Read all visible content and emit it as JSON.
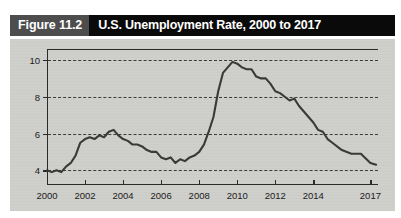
{
  "figure": {
    "number_label": "Figure 11.2",
    "title": "U.S. Unemployment Rate, 2000 to 2017",
    "number_bg_color": "#4d4d4d",
    "title_bg_color": "#0a0a0a",
    "title_text_color": "#ffffff",
    "panel_bg_color": "#cfcfcb",
    "line_color": "#3a3a3a",
    "grid_color": "#3c3c3c",
    "axis_color": "#2a2a2a"
  },
  "chart_data": {
    "type": "line",
    "title": "U.S. Unemployment Rate, 2000 to 2017",
    "xlabel": "",
    "ylabel": "",
    "xlim": [
      2000,
      2017.4
    ],
    "ylim": [
      3.2,
      10.6
    ],
    "grid": true,
    "grid_style": "dotted-horizontal",
    "legend": "none",
    "y_ticks": [
      4,
      6,
      8,
      10
    ],
    "y_tick_labels": [
      "4",
      "6",
      "8",
      "10"
    ],
    "x_ticks": [
      2000,
      2002,
      2004,
      2006,
      2008,
      2010,
      2012,
      2014,
      2017
    ],
    "x_tick_labels": [
      "2000",
      "2002",
      "2004",
      "2006",
      "2008",
      "2010",
      "2012",
      "2014",
      "2017"
    ],
    "series": [
      {
        "name": "Unemployment rate",
        "x": [
          2000.0,
          2000.25,
          2000.5,
          2000.75,
          2001.0,
          2001.25,
          2001.5,
          2001.75,
          2002.0,
          2002.25,
          2002.5,
          2002.75,
          2003.0,
          2003.25,
          2003.5,
          2003.75,
          2004.0,
          2004.25,
          2004.5,
          2004.75,
          2005.0,
          2005.25,
          2005.5,
          2005.75,
          2006.0,
          2006.25,
          2006.5,
          2006.75,
          2007.0,
          2007.25,
          2007.5,
          2007.75,
          2008.0,
          2008.25,
          2008.5,
          2008.75,
          2009.0,
          2009.25,
          2009.5,
          2009.75,
          2010.0,
          2010.25,
          2010.5,
          2010.75,
          2011.0,
          2011.25,
          2011.5,
          2011.75,
          2012.0,
          2012.25,
          2012.5,
          2012.75,
          2013.0,
          2013.25,
          2013.5,
          2013.75,
          2014.0,
          2014.25,
          2014.5,
          2014.75,
          2015.0,
          2015.5,
          2016.0,
          2016.5,
          2017.0,
          2017.3
        ],
        "values": [
          4.0,
          3.9,
          4.0,
          3.9,
          4.2,
          4.4,
          4.8,
          5.5,
          5.7,
          5.8,
          5.7,
          5.9,
          5.8,
          6.1,
          6.2,
          5.9,
          5.7,
          5.6,
          5.4,
          5.4,
          5.3,
          5.1,
          5.0,
          5.0,
          4.7,
          4.6,
          4.7,
          4.4,
          4.6,
          4.5,
          4.7,
          4.8,
          5.0,
          5.4,
          6.1,
          6.9,
          8.3,
          9.3,
          9.6,
          9.9,
          9.8,
          9.6,
          9.5,
          9.5,
          9.1,
          9.0,
          9.0,
          8.7,
          8.3,
          8.2,
          8.0,
          7.8,
          7.9,
          7.5,
          7.2,
          6.9,
          6.6,
          6.2,
          6.1,
          5.7,
          5.5,
          5.1,
          4.9,
          4.9,
          4.4,
          4.3
        ]
      }
    ],
    "annotations": [
      {
        "text": "peak near 10 percent during 2009-2010",
        "visible": false
      }
    ]
  }
}
